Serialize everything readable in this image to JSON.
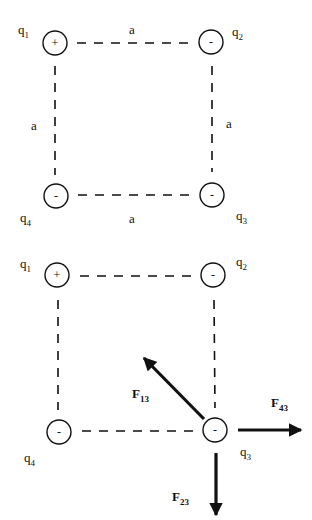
{
  "colors": {
    "ink": "#111111",
    "background": "#ffffff"
  },
  "diagrams": [
    {
      "name": "charge-square",
      "charges": [
        {
          "id": "q1",
          "label": "q",
          "sub": "1",
          "sign": "+",
          "cx": 55,
          "cy": 43,
          "r": 12,
          "lx": 18,
          "ly": 34
        },
        {
          "id": "q2",
          "label": "q",
          "sub": "2",
          "sign": "-",
          "cx": 211,
          "cy": 42,
          "r": 12,
          "lx": 232,
          "ly": 36
        },
        {
          "id": "q3",
          "label": "q",
          "sub": "3",
          "sign": "-",
          "cx": 212,
          "cy": 195,
          "r": 12,
          "lx": 236,
          "ly": 220
        },
        {
          "id": "q4",
          "label": "q",
          "sub": "4",
          "sign": "-",
          "cx": 56,
          "cy": 196,
          "r": 12,
          "lx": 20,
          "ly": 222
        }
      ],
      "edges": [
        {
          "x1": 77,
          "y1": 43,
          "x2": 190,
          "y2": 43
        },
        {
          "x1": 55,
          "y1": 66,
          "x2": 55,
          "y2": 175
        },
        {
          "x1": 212,
          "y1": 66,
          "x2": 212,
          "y2": 172
        },
        {
          "x1": 78,
          "y1": 195,
          "x2": 190,
          "y2": 195
        }
      ],
      "side_labels": [
        {
          "text": "a",
          "x": 129,
          "y": 34
        },
        {
          "text": "a",
          "x": 31,
          "y": 130
        },
        {
          "text": "a",
          "x": 226,
          "y": 128
        },
        {
          "text": "a",
          "x": 129,
          "y": 223
        }
      ],
      "forces": []
    },
    {
      "name": "force-diagram",
      "charges": [
        {
          "id": "q1",
          "label": "q",
          "sub": "1",
          "sign": "+",
          "cx": 57,
          "cy": 275,
          "r": 12,
          "lx": 20,
          "ly": 268
        },
        {
          "id": "q2",
          "label": "q",
          "sub": "2",
          "sign": "-",
          "cx": 213,
          "cy": 275,
          "r": 12,
          "lx": 236,
          "ly": 266
        },
        {
          "id": "q3",
          "label": "q",
          "sub": "3",
          "sign": "-",
          "cx": 215,
          "cy": 430,
          "r": 12,
          "lx": 240,
          "ly": 456
        },
        {
          "id": "q4",
          "label": "q",
          "sub": "4",
          "sign": "-",
          "cx": 59,
          "cy": 432,
          "r": 12,
          "lx": 24,
          "ly": 462
        }
      ],
      "edges": [
        {
          "x1": 80,
          "y1": 276,
          "x2": 192,
          "y2": 276
        },
        {
          "x1": 58,
          "y1": 300,
          "x2": 58,
          "y2": 410
        },
        {
          "x1": 214,
          "y1": 300,
          "x2": 215,
          "y2": 408
        },
        {
          "x1": 82,
          "y1": 431,
          "x2": 193,
          "y2": 431
        }
      ],
      "side_labels": [],
      "forces": [
        {
          "id": "F13",
          "label": "F",
          "sub": "13",
          "x1": 204,
          "y1": 419,
          "x2": 144,
          "y2": 358,
          "lx": 132,
          "ly": 398
        },
        {
          "id": "F43",
          "label": "F",
          "sub": "43",
          "x1": 238,
          "y1": 430,
          "x2": 301,
          "y2": 430,
          "lx": 271,
          "ly": 407
        },
        {
          "id": "F23",
          "label": "F",
          "sub": "23",
          "x1": 216,
          "y1": 453,
          "x2": 216,
          "y2": 515,
          "lx": 172,
          "ly": 501
        }
      ]
    }
  ]
}
